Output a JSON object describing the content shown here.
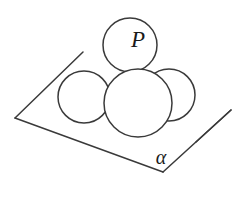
{
  "figure": {
    "background_color": "#ffffff",
    "stroke_color": "#3a3a3a",
    "label_color": "#1a1a1a",
    "width": 244,
    "height": 201,
    "plane": {
      "name": "alpha",
      "label": "α",
      "label_x": 161,
      "label_y": 159,
      "vertex_left": "15,118",
      "vertex_bottom": "163,172",
      "vertex_right": "231,110",
      "vertex_top": "83,52",
      "edge_bottom_left_points": "15,118 163,172",
      "edge_bottom_right_points": "163,172 231,110",
      "edge_top_left_points": "15,118 83,52",
      "edge_top_right_points": "231,110 196,142"
    },
    "spheres": [
      {
        "name": "left-sphere",
        "label": "",
        "cx": 84,
        "cy": 97,
        "r": 26
      },
      {
        "name": "right-sphere",
        "label": "",
        "cx": 169,
        "cy": 95,
        "r": 26
      },
      {
        "name": "front-sphere",
        "label": "",
        "cx": 138,
        "cy": 103,
        "r": 34
      },
      {
        "name": "top-sphere",
        "label": "P",
        "cx": 130,
        "cy": 45,
        "r": 27,
        "label_x": 138,
        "label_y": 42
      }
    ]
  }
}
